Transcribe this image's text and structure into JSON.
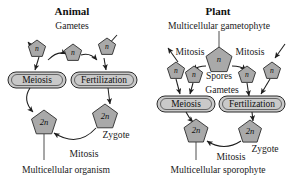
{
  "figure": {
    "background_color": "#ffffff",
    "pentagon_fill": "#a9a9a9",
    "capsule_fill": "#c9c9c9",
    "line_color": "#1e1e1e"
  },
  "animal": {
    "title": "Animal",
    "gametes_label": "Gametes",
    "meiosis_box": "Meiosis",
    "fertilization_box": "Fertilization",
    "mitosis_label": "Mitosis",
    "zygote_label": "Zygote",
    "organism_label": "Multicellular organism",
    "haploid_left": "n",
    "haploid_center": "n",
    "haploid_right": "n",
    "diploid_zygote": "2n",
    "diploid_organism": "2n"
  },
  "plant": {
    "title": "Plant",
    "gametophyte_label": "Multicellular gametophyte",
    "mitosis_left_label": "Mitosis",
    "mitosis_right_label": "Mitosis",
    "spores_label": "Spores",
    "gametes_label": "Gametes",
    "meiosis_box": "Meiosis",
    "fertilization_box": "Fertilization",
    "mitosis_bottom_label": "Mitosis",
    "zygote_label": "Zygote",
    "sporophyte_label": "Multicellular sporophyte",
    "haploid_gametophyte": "n",
    "haploid_spore_outer": "n",
    "haploid_spore_inner": "n",
    "haploid_gamete_inner": "n",
    "haploid_gamete_outer": "n",
    "diploid_zygote": "2n",
    "diploid_sporophyte": "2n"
  }
}
